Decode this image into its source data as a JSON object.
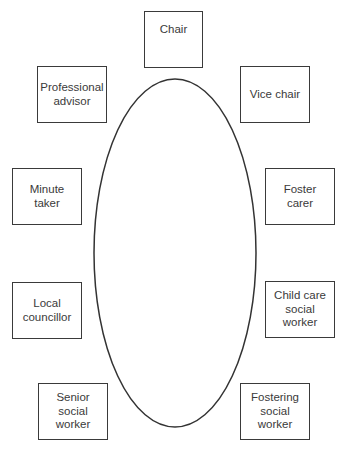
{
  "diagram": {
    "type": "seating-plan",
    "table": {
      "shape": "ellipse",
      "cx": 175,
      "cy": 253,
      "rx": 81,
      "ry": 174
    },
    "seats": [
      {
        "id": "chair",
        "lines": [
          "Chair"
        ],
        "x": 144,
        "y": 11,
        "w": 59,
        "h": 57,
        "align": "top"
      },
      {
        "id": "professional-advisor",
        "lines": [
          "Professional",
          "advisor"
        ],
        "x": 37,
        "y": 66,
        "w": 70,
        "h": 57,
        "align": "center"
      },
      {
        "id": "vice-chair",
        "lines": [
          "Vice chair"
        ],
        "x": 240,
        "y": 66,
        "w": 70,
        "h": 57,
        "align": "center"
      },
      {
        "id": "minute-taker",
        "lines": [
          "Minute",
          "taker"
        ],
        "x": 12,
        "y": 168,
        "w": 70,
        "h": 57,
        "align": "center"
      },
      {
        "id": "foster-carer",
        "lines": [
          "Foster",
          "carer"
        ],
        "x": 265,
        "y": 168,
        "w": 70,
        "h": 57,
        "align": "center"
      },
      {
        "id": "local-councillor",
        "lines": [
          "Local",
          "councillor"
        ],
        "x": 12,
        "y": 282,
        "w": 70,
        "h": 57,
        "align": "center"
      },
      {
        "id": "child-care-social-worker",
        "lines": [
          "Child care",
          "social",
          "worker"
        ],
        "x": 265,
        "y": 281,
        "w": 70,
        "h": 57,
        "align": "center"
      },
      {
        "id": "senior-social-worker",
        "lines": [
          "Senior",
          "social",
          "worker"
        ],
        "x": 38,
        "y": 383,
        "w": 70,
        "h": 57,
        "align": "center"
      },
      {
        "id": "fostering-social-worker",
        "lines": [
          "Fostering",
          "social",
          "worker"
        ],
        "x": 240,
        "y": 383,
        "w": 70,
        "h": 57,
        "align": "center"
      }
    ]
  }
}
